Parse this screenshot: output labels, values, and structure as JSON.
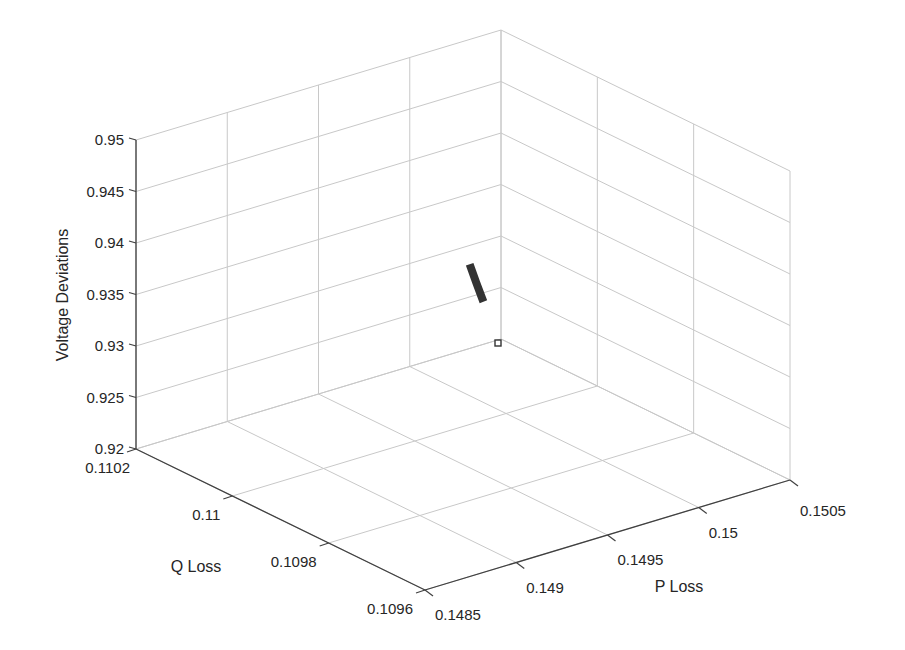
{
  "chart_data": {
    "type": "scatter",
    "dimensions": 3,
    "title": "",
    "xlabel": "P Loss",
    "ylabel": "Q Loss",
    "zlabel": "Voltage Deviations",
    "xlim": [
      0.1485,
      0.1505
    ],
    "ylim": [
      0.1096,
      0.1102
    ],
    "zlim": [
      0.92,
      0.95
    ],
    "x_ticks": [
      "0.1485",
      "0.149",
      "0.1495",
      "0.15",
      "0.1505"
    ],
    "y_ticks": [
      "0.1102",
      "0.11",
      "0.1098",
      "0.1096"
    ],
    "z_ticks": [
      "0.95",
      "0.945",
      "0.94",
      "0.935",
      "0.93",
      "0.925",
      "0.92"
    ],
    "grid": true,
    "legend": null,
    "series": [
      {
        "name": "Pareto solutions",
        "marker": "filled-square-dense",
        "color": "#333333",
        "points": [
          {
            "p_loss": 0.15048,
            "q_loss": 0.11019,
            "v_dev": 0.9371
          },
          {
            "p_loss": 0.15049,
            "q_loss": 0.11019,
            "v_dev": 0.9365
          },
          {
            "p_loss": 0.15049,
            "q_loss": 0.11018,
            "v_dev": 0.936
          },
          {
            "p_loss": 0.1505,
            "q_loss": 0.11017,
            "v_dev": 0.9355
          },
          {
            "p_loss": 0.1505,
            "q_loss": 0.11017,
            "v_dev": 0.935
          },
          {
            "p_loss": 0.1505,
            "q_loss": 0.11016,
            "v_dev": 0.9346
          }
        ]
      },
      {
        "name": "Selected solution",
        "marker": "hollow-square",
        "color": "#333333",
        "points": [
          {
            "p_loss": 0.15049,
            "q_loss": 0.1102,
            "v_dev": 0.93
          }
        ]
      }
    ]
  },
  "axes": {
    "z_label": "Voltage Deviations",
    "y_label": "Q Loss",
    "x_label": "P Loss"
  }
}
